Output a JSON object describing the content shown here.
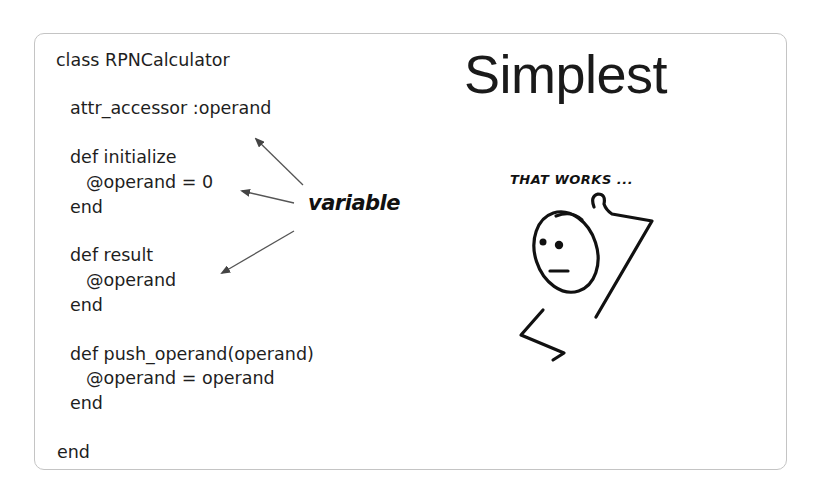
{
  "slide": {
    "title": "Simplest",
    "subtitle": "THAT WORKS ...",
    "annotation": "variable",
    "code": {
      "lines": [
        {
          "text": "class RPNCalculator",
          "indent": 0
        },
        {
          "text": "attr_accessor :operand",
          "indent": 1
        },
        {
          "text": "def initialize",
          "indent": 1
        },
        {
          "text": "@operand = 0",
          "indent": 2
        },
        {
          "text": "end",
          "indent": 1
        },
        {
          "text": "def result",
          "indent": 1
        },
        {
          "text": "@operand",
          "indent": 2
        },
        {
          "text": "end",
          "indent": 1
        },
        {
          "text": "def push_operand(operand)",
          "indent": 1
        },
        {
          "text": "@operand = operand",
          "indent": 2
        },
        {
          "text": "end",
          "indent": 1
        },
        {
          "text": "end",
          "indent": 0
        }
      ]
    },
    "illustration": {
      "icon": "stick-figure-shrug-icon",
      "arrows": [
        "arrow-to-attr-accessor",
        "arrow-to-initialize-assignment",
        "arrow-to-result-operand"
      ]
    },
    "colors": {
      "text": "#1e1e1e",
      "border": "#c4c4c4",
      "background": "#ffffff",
      "arrow": "#555555"
    }
  }
}
